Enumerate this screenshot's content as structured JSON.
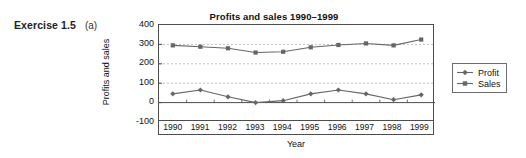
{
  "exercise": {
    "number": "Exercise 1.5",
    "part": "(a)"
  },
  "chart_data": {
    "type": "line",
    "title": "Profits and sales 1990–1999",
    "xlabel": "Year",
    "ylabel": "Profits and sales",
    "categories": [
      "1990",
      "1991",
      "1992",
      "1993",
      "1994",
      "1995",
      "1996",
      "1997",
      "1998",
      "1999"
    ],
    "ylim": [
      -100,
      400
    ],
    "yticks": [
      400,
      300,
      200,
      100,
      0,
      -100
    ],
    "ytick_labels": [
      "400",
      "300",
      "200",
      "100",
      "0",
      "-100"
    ],
    "grid": "horizontal-dashed",
    "legend_position": "right",
    "series": [
      {
        "name": "Profit",
        "marker": "diamond",
        "color": "#666666",
        "values": [
          45,
          65,
          30,
          0,
          10,
          45,
          65,
          45,
          15,
          40
        ]
      },
      {
        "name": "Sales",
        "marker": "square",
        "color": "#666666",
        "values": [
          295,
          288,
          280,
          258,
          262,
          285,
          297,
          305,
          295,
          325
        ]
      }
    ]
  },
  "legend": {
    "items": [
      {
        "label": "Profit",
        "marker": "diamond-marker-icon"
      },
      {
        "label": "Sales",
        "marker": "square-marker-icon"
      }
    ]
  }
}
